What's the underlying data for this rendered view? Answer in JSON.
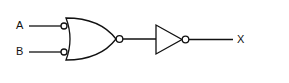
{
  "diagram": {
    "type": "logic-circuit",
    "inputs": [
      {
        "label": "A"
      },
      {
        "label": "B"
      }
    ],
    "output": {
      "label": "X"
    },
    "gates": [
      {
        "id": "g1",
        "kind": "OR with inverted inputs and inverted output",
        "inputs": [
          "A",
          "B"
        ]
      },
      {
        "id": "g2",
        "kind": "NOT",
        "inputs": [
          "g1"
        ]
      }
    ],
    "stroke_color": "#111111"
  }
}
